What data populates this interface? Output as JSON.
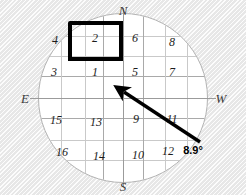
{
  "figure": {
    "type": "compass-grid-diagram",
    "background_color": "#ececec",
    "dial_color": "#ffffff",
    "grid_color": "#c9c9c9",
    "highlight_color": "#000000",
    "arrow_color": "#000000"
  },
  "compass": {
    "north": "N",
    "south": "S",
    "east": "E",
    "west": "W"
  },
  "bearing": {
    "value": "8.9°",
    "arrow": {
      "from_x": 200,
      "from_y": 142,
      "to_x": 124,
      "to_y": 92
    }
  },
  "highlight": {
    "cell_label": "2"
  },
  "cells": [
    {
      "label": "4",
      "x": 55,
      "y": 40
    },
    {
      "label": "2",
      "x": 95,
      "y": 38
    },
    {
      "label": "6",
      "x": 135,
      "y": 38
    },
    {
      "label": "8",
      "x": 172,
      "y": 42
    },
    {
      "label": "3",
      "x": 54,
      "y": 72
    },
    {
      "label": "1",
      "x": 95,
      "y": 72
    },
    {
      "label": "5",
      "x": 135,
      "y": 72
    },
    {
      "label": "7",
      "x": 172,
      "y": 72
    },
    {
      "label": "15",
      "x": 56,
      "y": 120
    },
    {
      "label": "13",
      "x": 96,
      "y": 122
    },
    {
      "label": "9",
      "x": 136,
      "y": 119
    },
    {
      "label": "11",
      "x": 172,
      "y": 119
    },
    {
      "label": "16",
      "x": 62,
      "y": 152
    },
    {
      "label": "14",
      "x": 99,
      "y": 156
    },
    {
      "label": "10",
      "x": 138,
      "y": 155
    },
    {
      "label": "12",
      "x": 168,
      "y": 151
    }
  ],
  "grid": {
    "horizontal_lines": [
      22,
      42,
      62,
      84,
      104,
      126,
      146
    ],
    "vertical_lines": [
      22,
      46,
      64,
      84,
      104,
      126,
      148
    ],
    "major_horizontal": [
      62,
      104
    ],
    "major_vertical": [
      64,
      104
    ]
  }
}
